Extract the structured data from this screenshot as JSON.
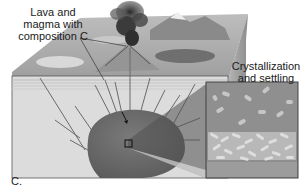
{
  "diagram": {
    "labels": {
      "lava_line1": "Lava and",
      "lava_line2": "magma with",
      "lava_line3": "composition C",
      "cryst_line1": "Crystallization",
      "cryst_line2": "and settling"
    },
    "caption": "C.",
    "elements": [
      "surface landscape with mountains",
      "volcano erupting ash plume",
      "layered crust block cross-section",
      "magma chamber with dikes",
      "inset box showing crystals settling"
    ],
    "colors": {
      "crust_fill": "#d9d9d9",
      "magma_chamber": "#6e6e6e",
      "inset_bg": "#8f8f8f",
      "crystal": "#c9c9c9",
      "plume": "#3a3a3a",
      "outline": "#444444"
    }
  }
}
